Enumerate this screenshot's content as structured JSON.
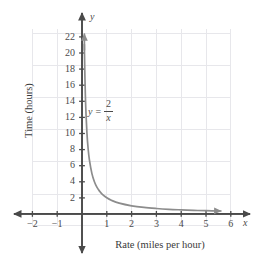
{
  "chart_data": {
    "type": "line",
    "title": "",
    "subtitle": "",
    "xlabel": "Rate (miles per hour)",
    "ylabel": "Time (hours)",
    "axis_name_x": "x",
    "axis_name_y": "y",
    "equation_label": {
      "lhs": "y",
      "equals": "=",
      "numerator": "2",
      "denominator": "x",
      "plain": "y = 2/x"
    },
    "grid": true,
    "grid_color": "#e6e6ea",
    "curve_color": "#8c8c8c",
    "axis_color": "#4a4a4a",
    "legend": "none",
    "xlim": [
      -2.8,
      6.8
    ],
    "ylim": [
      -3.0,
      23.5
    ],
    "xticks": [
      -2,
      -1,
      1,
      2,
      3,
      4,
      5,
      6
    ],
    "xtick_labels": [
      "−2",
      "−1",
      "1",
      "2",
      "3",
      "4",
      "5",
      "6"
    ],
    "yticks": [
      2,
      4,
      6,
      8,
      10,
      12,
      14,
      16,
      18,
      20,
      22
    ],
    "ytick_labels": [
      "2",
      "4",
      "6",
      "8",
      "10",
      "12",
      "14",
      "16",
      "18",
      "20",
      "22"
    ],
    "series": [
      {
        "name": "y = 2/x",
        "formula": "y = 2 / x",
        "domain": [
          0.095,
          5.6
        ],
        "arrow_start": true,
        "arrow_end": true,
        "x": [
          0.095,
          0.1,
          0.12,
          0.15,
          0.2,
          0.25,
          0.3,
          0.4,
          0.5,
          0.6,
          0.7,
          0.8,
          1.0,
          1.2,
          1.5,
          2.0,
          2.5,
          3.0,
          3.5,
          4.0,
          4.5,
          5.0,
          5.6
        ],
        "y": [
          21.05,
          20.0,
          16.67,
          13.33,
          10.0,
          8.0,
          6.67,
          5.0,
          4.0,
          3.33,
          2.86,
          2.5,
          2.0,
          1.67,
          1.33,
          1.0,
          0.8,
          0.67,
          0.57,
          0.5,
          0.44,
          0.4,
          0.36
        ]
      }
    ]
  }
}
